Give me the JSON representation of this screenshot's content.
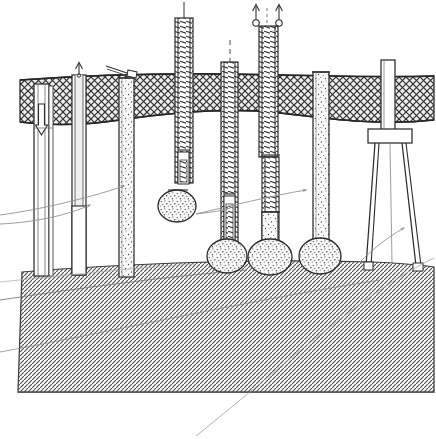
{
  "figure": {
    "title": "Bored cast-in-place pile construction sequence (hand-drawn section)",
    "style": "pen-and-ink line drawing, monochrome",
    "width": 436,
    "height": 439,
    "colors": {
      "ink": "#2b2b2b",
      "ink_light": "#6f6f6f",
      "paper": "#ffffff",
      "soil_fill": "#e9e9e9",
      "rock_fill": "#d8d8d8",
      "concrete_fill": "#f2f2f2"
    }
  },
  "strata": [
    {
      "name": "upper-soil-band",
      "label": "Upper soil stratum (cross-hatched / basket-weave hatch)",
      "hatch": "cross-hatch",
      "top_y": 74,
      "bottom_y": 128,
      "note": "Band runs full width; lower boundary is wavy/undulating"
    },
    {
      "name": "intermediate-soft-layer",
      "label": "Intermediate soft layer (blank / unhatched)",
      "hatch": "none",
      "top_y": 128,
      "bottom_y": 262
    },
    {
      "name": "lower-bearing-stratum",
      "label": "Lower bearing stratum (45 degree diagonal hatch)",
      "hatch": "diagonal-45",
      "top_y": 262,
      "bottom_y": 397,
      "note": "Surface drawn in perspective with two internal break lines"
    }
  ],
  "elements": [
    {
      "id": 1,
      "name": "pile-1-casing-drive",
      "label": "Stage 1 - Hollow steel casing driven, plug being driven down",
      "x": 34,
      "top": 84,
      "width": 14,
      "bottom": 276,
      "fill": "hollow",
      "annotation_icon": "down-arrow-icon",
      "annotation_note": "Downward arrow inside casing = internal drive / plug displacement"
    },
    {
      "id": 2,
      "name": "pile-2-casing-withdraw",
      "label": "Stage 2 - Casing withdrawn / auger extraction",
      "x": 72,
      "top": 64,
      "width": 13,
      "bottom": 275,
      "fill": "hollow",
      "annotation_icon": "up-arrow-icon",
      "annotation_note": "Upward arrow above casing head = casing being pulled"
    },
    {
      "id": 3,
      "name": "pile-3-concrete-placement",
      "label": "Stage 3 - Shaft charged with concrete via tremie chute",
      "x": 119,
      "top": 76,
      "width": 14,
      "bottom": 277,
      "fill": "stipple-concrete",
      "annotation_icon": "tremie-chute-icon",
      "annotation_note": "Inclined chute / tremie pipe at pile head"
    },
    {
      "id": 4,
      "name": "tool-4-expander-on-cage",
      "label": "Stage 4 - Base expander tool lowered on ladder mast, bulb formed",
      "x": 176,
      "top": 14,
      "width": 17,
      "bottom": 183,
      "fill": "ladder-reinforcement",
      "base": {
        "type": "bulb",
        "cx": 176,
        "cy": 205,
        "rx": 19,
        "ry": 16
      },
      "annotation_icon": "mast-line-icon",
      "annotation_note": "Suspended hanging bulb, not yet founded on stratum"
    },
    {
      "id": 5,
      "name": "pile-5-cage-lowered",
      "label": "Stage 5 - Reinforcement cage lowered to enlarged base",
      "x": 222,
      "top": 62,
      "width": 16,
      "bottom": 243,
      "fill": "ladder-reinforcement",
      "base": {
        "type": "bulb",
        "cx": 226,
        "cy": 256,
        "rx": 20,
        "ry": 17
      },
      "annotation_icon": "mast-line-icon",
      "annotation_note": "Inner core tool shown inside cage near base"
    },
    {
      "id": 6,
      "name": "pile-6-cage-withdraw-twin",
      "label": "Stage 6 - Twin-line extraction of casing while concreting",
      "x": 262,
      "top": 14,
      "width": 18,
      "bottom": 245,
      "fill": "ladder-then-concrete",
      "base": {
        "type": "bulb",
        "cx": 269,
        "cy": 257,
        "rx": 22,
        "ry": 18
      },
      "annotation_icon": "double-up-arrow-pulley-icon",
      "annotation_note": "Two upward arrows with sheave/pulley circles at head"
    },
    {
      "id": 7,
      "name": "pile-7-completed",
      "label": "Stage 7 - Completed under-reamed concrete pile",
      "x": 314,
      "top": 70,
      "width": 15,
      "bottom": 244,
      "fill": "stipple-concrete",
      "base": {
        "type": "bulb",
        "cx": 319,
        "cy": 256,
        "rx": 21,
        "ry": 18
      },
      "annotation_icon": "leader-arrow-icon",
      "annotation_note": "Final shaft with flared under-ream base"
    },
    {
      "id": 8,
      "name": "rig-8-tripod-frame",
      "label": "Stage 8 - Tripod driving frame with spreader plate",
      "x": 382,
      "top": 60,
      "width": 13,
      "bottom": 268,
      "fill": "hollow",
      "crosshead": {
        "x": 370,
        "y": 130,
        "width": 48,
        "height": 14
      },
      "legs": 3,
      "annotation_icon": "leader-arrow-icon",
      "annotation_note": "Splayed legs bear on lower stratum surface"
    }
  ],
  "leader_lines": [
    {
      "name": "leader-line-left-upper",
      "note": "Long curved leader sweeping from lower-left up to pile 3 head"
    },
    {
      "name": "leader-line-left-lower",
      "note": "Second curved leader to pile 2 shaft"
    },
    {
      "name": "leader-line-mid",
      "note": "Curved leader from pile 5 base up toward pile 7"
    },
    {
      "name": "leader-line-right",
      "note": "Curved leader from rock surface to tripod leg"
    },
    {
      "name": "leader-line-long-sweep",
      "note": "Long arc crossing lower stratum to bottom edge of sheet"
    }
  ]
}
